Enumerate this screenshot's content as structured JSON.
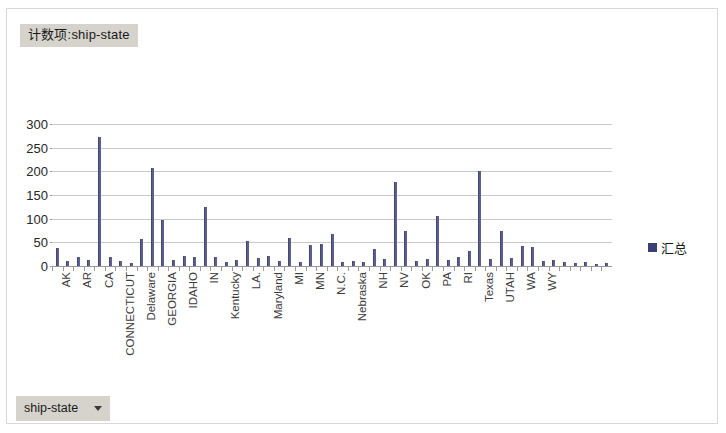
{
  "window": {
    "background_color": "#ffffff",
    "border_color": "#d9d9d9"
  },
  "pivot_title": {
    "label": "计数项:ship-state"
  },
  "filter_button": {
    "label": "ship-state",
    "caret_icon": "chevron-down-icon"
  },
  "legend": {
    "entries": [
      {
        "label": "汇总",
        "color": "#3b3f74"
      }
    ],
    "position": "right"
  },
  "chart_data": {
    "type": "bar",
    "title": "计数项:ship-state",
    "xlabel": "",
    "ylabel": "",
    "ylim": [
      0,
      300
    ],
    "yticks": [
      0,
      50,
      100,
      150,
      200,
      250,
      300
    ],
    "grid": true,
    "series_name": "汇总",
    "bar_color": "#5c5f8f",
    "categories": [
      "AK",
      "AL",
      "AR",
      "AZ",
      "CA",
      "CO",
      "CONNECTICUT",
      "DC",
      "Delaware",
      "FL",
      "GEORGIA",
      "HI",
      "IDAHO",
      "IL",
      "IN",
      "IOWA",
      "Kentucky",
      "KS",
      "LA.",
      "MA",
      "Maryland",
      "ME",
      "MI",
      "MISSOURI",
      "MN",
      "MS",
      "N.C.",
      "ND",
      "Nebraska",
      "NEW JERSEY",
      "NH",
      "NM",
      "NV",
      "NY",
      "OK",
      "OR",
      "PA",
      "PR",
      "RI",
      "SC",
      "Texas",
      "TN",
      "UTAH",
      "VA",
      "WA",
      "VT",
      "WY",
      "WI",
      "SD",
      "MT",
      "DE",
      "AA",
      "GU"
    ],
    "tick_labels_shown": [
      "AK",
      "AR",
      "CA",
      "CONNECTICUT",
      "Delaware",
      "GEORGIA",
      "IDAHO",
      "IN",
      "Kentucky",
      "LA.",
      "Maryland",
      "MI",
      "MN",
      "N.C.",
      "Nebraska",
      "NH",
      "NV",
      "OK",
      "PA",
      "RI",
      "Texas",
      "UTAH",
      "WA",
      "WY"
    ],
    "values": [
      38,
      10,
      18,
      13,
      272,
      18,
      10,
      7,
      57,
      207,
      98,
      12,
      22,
      20,
      124,
      18,
      8,
      12,
      52,
      16,
      22,
      11,
      60,
      8,
      44,
      46,
      68,
      8,
      10,
      8,
      36,
      14,
      178,
      73,
      10,
      14,
      105,
      12,
      18,
      32,
      200,
      14,
      75,
      17,
      42,
      40,
      10,
      12,
      8,
      6,
      9,
      5,
      7
    ]
  }
}
